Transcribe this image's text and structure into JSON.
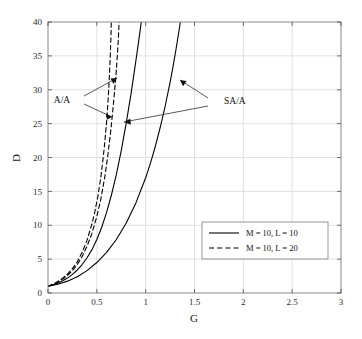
{
  "chart_data": {
    "type": "line",
    "title": "",
    "xlabel": "G",
    "ylabel": "D",
    "xlim": [
      0,
      3
    ],
    "ylim": [
      0,
      40
    ],
    "grid": true,
    "xticks": [
      "0",
      "0.5",
      "1",
      "1.5",
      "2",
      "2.5",
      "3"
    ],
    "xtick_values": [
      0,
      0.5,
      1,
      1.5,
      2,
      2.5,
      3
    ],
    "yticks": [
      "0",
      "5",
      "10",
      "15",
      "20",
      "25",
      "30",
      "35",
      "40"
    ],
    "ytick_values": [
      0,
      5,
      10,
      15,
      20,
      25,
      30,
      35,
      40
    ],
    "legend": {
      "position": "center-right",
      "entries": [
        {
          "label": "M = 10, L = 10",
          "style": "solid"
        },
        {
          "label": "M = 10, L = 20",
          "style": "dashed"
        }
      ]
    },
    "annotations": [
      {
        "text": "A/A",
        "points_to": [
          "dashed-curve-1",
          "dashed-curve-2"
        ]
      },
      {
        "text": "SA/A",
        "points_to": [
          "solid-curve-1",
          "solid-curve-2"
        ]
      }
    ],
    "series": [
      {
        "name": "A/A, M = 10, L = 20 (inner dashed)",
        "style": "dashed",
        "color": "#000000",
        "points": [
          [
            0.0,
            1.0
          ],
          [
            0.05,
            1.3
          ],
          [
            0.1,
            1.7
          ],
          [
            0.15,
            2.2
          ],
          [
            0.2,
            2.8
          ],
          [
            0.25,
            3.6
          ],
          [
            0.3,
            4.6
          ],
          [
            0.35,
            6.0
          ],
          [
            0.4,
            7.8
          ],
          [
            0.45,
            10.2
          ],
          [
            0.48,
            12.0
          ],
          [
            0.51,
            14.2
          ],
          [
            0.54,
            17.0
          ],
          [
            0.56,
            19.3
          ],
          [
            0.58,
            22.0
          ],
          [
            0.6,
            25.3
          ],
          [
            0.61,
            27.3
          ],
          [
            0.62,
            29.6
          ],
          [
            0.625,
            31.0
          ],
          [
            0.63,
            32.5
          ],
          [
            0.635,
            34.2
          ],
          [
            0.64,
            36.0
          ],
          [
            0.645,
            38.0
          ],
          [
            0.648,
            40.0
          ]
        ]
      },
      {
        "name": "A/A, M = 10, L = 20 (outer dashed)",
        "style": "dashed",
        "color": "#000000",
        "points": [
          [
            0.0,
            1.0
          ],
          [
            0.05,
            1.25
          ],
          [
            0.1,
            1.6
          ],
          [
            0.15,
            2.05
          ],
          [
            0.2,
            2.6
          ],
          [
            0.25,
            3.3
          ],
          [
            0.3,
            4.2
          ],
          [
            0.35,
            5.4
          ],
          [
            0.4,
            6.9
          ],
          [
            0.45,
            8.8
          ],
          [
            0.5,
            11.3
          ],
          [
            0.54,
            13.8
          ],
          [
            0.58,
            17.0
          ],
          [
            0.61,
            20.0
          ],
          [
            0.64,
            23.6
          ],
          [
            0.66,
            26.4
          ],
          [
            0.68,
            29.5
          ],
          [
            0.695,
            32.0
          ],
          [
            0.705,
            34.0
          ],
          [
            0.715,
            36.2
          ],
          [
            0.722,
            38.0
          ],
          [
            0.728,
            40.0
          ]
        ]
      },
      {
        "name": "SA/A, M = 10, L = 10 (inner solid)",
        "style": "solid",
        "color": "#000000",
        "points": [
          [
            0.0,
            1.0
          ],
          [
            0.05,
            1.2
          ],
          [
            0.1,
            1.45
          ],
          [
            0.15,
            1.8
          ],
          [
            0.2,
            2.2
          ],
          [
            0.25,
            2.75
          ],
          [
            0.3,
            3.4
          ],
          [
            0.35,
            4.2
          ],
          [
            0.4,
            5.2
          ],
          [
            0.45,
            6.4
          ],
          [
            0.5,
            7.9
          ],
          [
            0.55,
            9.7
          ],
          [
            0.6,
            11.9
          ],
          [
            0.65,
            14.5
          ],
          [
            0.7,
            17.5
          ],
          [
            0.75,
            21.0
          ],
          [
            0.8,
            25.0
          ],
          [
            0.85,
            29.4
          ],
          [
            0.88,
            32.3
          ],
          [
            0.91,
            35.3
          ],
          [
            0.94,
            38.4
          ],
          [
            0.955,
            40.0
          ]
        ]
      },
      {
        "name": "SA/A, M = 10, L = 10 (outer solid)",
        "style": "solid",
        "color": "#000000",
        "points": [
          [
            0.0,
            1.0
          ],
          [
            0.1,
            1.3
          ],
          [
            0.2,
            1.75
          ],
          [
            0.3,
            2.4
          ],
          [
            0.4,
            3.3
          ],
          [
            0.5,
            4.5
          ],
          [
            0.6,
            6.0
          ],
          [
            0.7,
            7.9
          ],
          [
            0.8,
            10.3
          ],
          [
            0.9,
            13.3
          ],
          [
            1.0,
            17.0
          ],
          [
            1.05,
            19.2
          ],
          [
            1.1,
            21.7
          ],
          [
            1.15,
            24.5
          ],
          [
            1.2,
            27.6
          ],
          [
            1.25,
            31.1
          ],
          [
            1.28,
            33.4
          ],
          [
            1.31,
            35.9
          ],
          [
            1.34,
            38.6
          ],
          [
            1.355,
            40.0
          ]
        ]
      }
    ]
  },
  "colors": {
    "background": "#ffffff",
    "axis": "#8a8a8a",
    "grid": "#d9d9d9",
    "curve": "#000000",
    "text": "#1a1a1a",
    "legend_border": "#8a8a8a"
  }
}
